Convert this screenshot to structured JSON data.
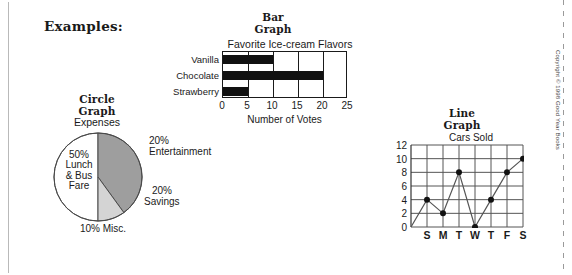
{
  "page": {
    "heading": "Examples:",
    "copyright": "Copyright © 1998 Good Year Books"
  },
  "bar_graph": {
    "title_line1": "Bar",
    "title_line2": "Graph",
    "xlabel": "Number of Votes"
  },
  "circle_graph": {
    "title_line1": "Circle",
    "title_line2": "Graph",
    "subtitle": "Expenses",
    "label_lunch": "50%\nLunch\n& Bus\nFare",
    "label_lunch_l1": "50%",
    "label_lunch_l2": "Lunch",
    "label_lunch_l3": "& Bus",
    "label_lunch_l4": "Fare",
    "label_ent_l1": "20%",
    "label_ent_l2": "Entertainment",
    "label_sav_l1": "20%",
    "label_sav_l2": "Savings",
    "label_misc": "10% Misc."
  },
  "line_graph": {
    "title_line1": "Line",
    "title_line2": "Graph"
  },
  "chart_data": [
    {
      "type": "bar",
      "orientation": "horizontal",
      "title": "Favorite Ice-cream Flavors",
      "categories": [
        "Vanilla",
        "Chocolate",
        "Strawberry"
      ],
      "values": [
        10,
        20,
        5
      ],
      "xlabel": "Number of Votes",
      "ylabel": "",
      "xlim": [
        0,
        25
      ],
      "xticks": [
        0,
        5,
        10,
        15,
        20,
        25
      ],
      "grid": true,
      "bar_color": "#111111"
    },
    {
      "type": "pie",
      "title": "Expenses",
      "labels": [
        "Lunch & Bus Fare",
        "Entertainment",
        "Savings",
        "Misc."
      ],
      "values": [
        50,
        20,
        20,
        10
      ],
      "colors": [
        "#ffffff",
        "#9e9e9e",
        "#9e9e9e",
        "#d0d0d0"
      ],
      "legend": "none"
    },
    {
      "type": "line",
      "title": "Cars Sold",
      "categories": [
        "S",
        "M",
        "T",
        "W",
        "T",
        "F",
        "S"
      ],
      "values": [
        4,
        2,
        8,
        0,
        4,
        8,
        10
      ],
      "xlabel": "",
      "ylabel": "",
      "ylim": [
        0,
        12
      ],
      "yticks": [
        0,
        2,
        4,
        6,
        8,
        10,
        12
      ],
      "grid": true,
      "marker": "circle",
      "line_color": "#555555"
    }
  ]
}
